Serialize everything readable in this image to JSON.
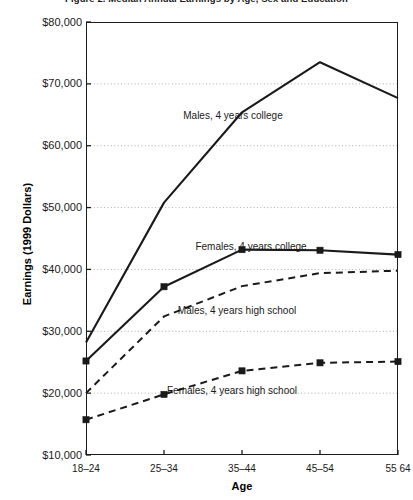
{
  "chart_data": {
    "type": "line",
    "title": "Figure 2.  Median Annual Earnings by Age, Sex and Education",
    "xlabel": "Age",
    "ylabel": "Earnings (1999 Dollars)",
    "categories": [
      "18–24",
      "25–34",
      "35–44",
      "45–54",
      "55 64"
    ],
    "ylim": [
      10000,
      80000
    ],
    "ytick_labels": [
      "$10,000",
      "$20,000",
      "$30,000",
      "$40,000",
      "$50,000",
      "$60,000",
      "$70,000",
      "$80,000"
    ],
    "ytick_values": [
      10000,
      20000,
      30000,
      40000,
      50000,
      60000,
      70000,
      80000
    ],
    "grid": "horizontal-dotted",
    "legend_position": "inline-annotations",
    "series": [
      {
        "name": "Males, 4 years college",
        "style": "solid",
        "marker": "none",
        "values": [
          28200,
          50800,
          65400,
          73500,
          67700
        ],
        "label_x": 233,
        "label_y": 110
      },
      {
        "name": "Females, 4 years college",
        "style": "solid",
        "marker": "square",
        "values": [
          25200,
          37200,
          43200,
          43100,
          42400
        ],
        "label_x": 251,
        "label_y": 241
      },
      {
        "name": "Males, 4 years high school",
        "style": "dashed",
        "marker": "none",
        "values": [
          20000,
          32400,
          37300,
          39400,
          39800
        ],
        "label_x": 237,
        "label_y": 305
      },
      {
        "name": "Females, 4 years high school",
        "style": "dashed",
        "marker": "square",
        "values": [
          15700,
          19800,
          23600,
          24900,
          25100
        ],
        "label_x": 232,
        "label_y": 385
      }
    ]
  },
  "colors": {
    "line": "#1a1a1a",
    "grid": "#9a9a9a",
    "frame": "#1c1c1c",
    "background": "#ffffff",
    "text": "#1a1a1a"
  }
}
